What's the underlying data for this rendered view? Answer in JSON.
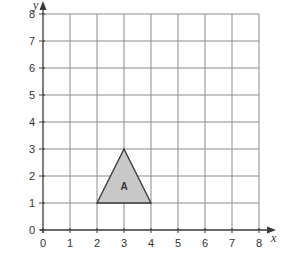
{
  "diagram": {
    "type": "coordinate-grid",
    "axes": {
      "x": {
        "label": "x",
        "min": 0,
        "max": 8,
        "ticks": [
          "0",
          "1",
          "2",
          "3",
          "4",
          "5",
          "6",
          "7",
          "8"
        ]
      },
      "y": {
        "label": "y",
        "min": 0,
        "max": 8,
        "ticks": [
          "0",
          "1",
          "2",
          "3",
          "4",
          "5",
          "6",
          "7",
          "8"
        ]
      }
    },
    "grid": {
      "on": true,
      "step": 1,
      "color": "#8c8c8c"
    },
    "shapes": [
      {
        "name": "A",
        "kind": "triangle",
        "vertices": [
          [
            2,
            1
          ],
          [
            3,
            3
          ],
          [
            4,
            1
          ]
        ],
        "fill": "#c8c8c8",
        "stroke": "#3a3a3a",
        "label_position": [
          3,
          1.6
        ]
      }
    ]
  },
  "layout": {
    "origin_px": [
      43,
      230
    ],
    "unit_px": 27,
    "axis_color": "#3a3a3a",
    "text_color": "#333333"
  }
}
